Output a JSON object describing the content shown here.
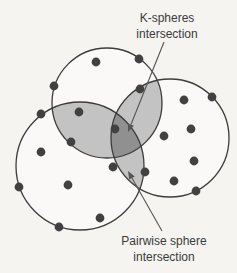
{
  "figure": {
    "width": 237,
    "height": 273,
    "background": "#f5f4f1",
    "circle_fill": "#faf9f7",
    "stroke_color": "#3c3c3c",
    "stroke_width": 1.3,
    "pairwise_fill": "#c3c3c3",
    "triple_fill": "#909090",
    "dot_color": "#414141",
    "dot_radius": 4.4,
    "arrow_color": "#555555",
    "spheres": [
      {
        "name": "top-sphere",
        "cx": 107,
        "cy": 103,
        "r": 55
      },
      {
        "name": "left-sphere",
        "cx": 80,
        "cy": 166,
        "r": 64
      },
      {
        "name": "right-sphere",
        "cx": 170,
        "cy": 138,
        "r": 59
      }
    ],
    "points": [
      [
        96,
        62
      ],
      [
        139,
        59
      ],
      [
        54,
        86
      ],
      [
        184,
        100
      ],
      [
        212,
        97
      ],
      [
        140,
        89
      ],
      [
        41,
        114
      ],
      [
        79,
        112
      ],
      [
        115,
        129
      ],
      [
        191,
        129
      ],
      [
        71,
        142
      ],
      [
        41,
        152
      ],
      [
        164,
        136
      ],
      [
        194,
        161
      ],
      [
        113,
        167
      ],
      [
        145,
        172
      ],
      [
        19,
        187
      ],
      [
        68,
        185
      ],
      [
        174,
        181
      ],
      [
        196,
        191
      ],
      [
        100,
        218
      ],
      [
        59,
        227
      ]
    ],
    "arrows": [
      {
        "name": "k-spheres-arrow",
        "from": [
          164,
          42
        ],
        "to": [
          128,
          132
        ]
      },
      {
        "name": "pairwise-arrow",
        "from": [
          162,
          231
        ],
        "to": [
          128,
          171
        ]
      }
    ],
    "labels": {
      "k_spheres": {
        "line1": "K-spheres",
        "line2": "intersection",
        "x": 167,
        "y": 11
      },
      "pairwise": {
        "line1": "Pairwise sphere",
        "line2": "intersection",
        "x": 164,
        "y": 234
      }
    }
  }
}
